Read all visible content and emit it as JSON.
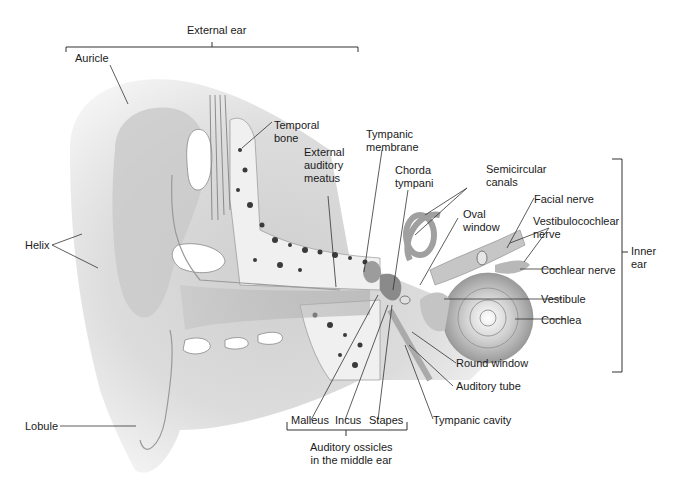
{
  "diagram": {
    "groups": {
      "external_ear": "External ear",
      "inner_ear": "Inner\near",
      "ossicles": "Auditory ossicles\nin the middle ear"
    },
    "labels": {
      "auricle": "Auricle",
      "helix": "Helix",
      "lobule": "Lobule",
      "temporal_bone": "Temporal\nbone",
      "external_auditory_meatus": "External\nauditory\nmeatus",
      "tympanic_membrane": "Tympanic\nmembrane",
      "chorda_tympani": "Chorda\ntympani",
      "semicircular_canals": "Semicircular\ncanals",
      "oval_window": "Oval\nwindow",
      "facial_nerve": "Facial nerve",
      "vestibulocochlear_nerve": "Vestibulocochlear\nnerve",
      "cochlear_nerve": "Cochlear nerve",
      "vestibule": "Vestibule",
      "cochlea": "Cochlea",
      "round_window": "Round window",
      "auditory_tube": "Auditory tube",
      "tympanic_cavity": "Tympanic cavity",
      "malleus": "Malleus",
      "incus": "Incus",
      "stapes": "Stapes"
    },
    "colors": {
      "background": "#ffffff",
      "text": "#1a1a1a",
      "leader_line": "#333333",
      "skin_light": "#e6e6e6",
      "skin_mid": "#bdbdbd",
      "skin_dark": "#8c8c8c",
      "bone": "#f2f2f2",
      "bone_pore": "#3a3a3a"
    }
  }
}
